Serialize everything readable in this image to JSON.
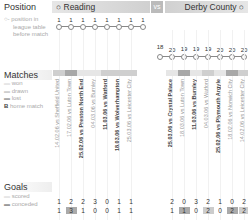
{
  "header": {
    "position_title": "Position",
    "home_team": "Reading",
    "vs": "vs",
    "away_team": "Derby County"
  },
  "legend": {
    "position": [
      "position in",
      "league table",
      "before match"
    ],
    "matches_title": "Matches",
    "matches": [
      "won",
      "drawn",
      "lost",
      "home match"
    ],
    "goals_title": "Goals",
    "goals": [
      "scored",
      "conceded"
    ]
  },
  "colors": {
    "won": "#e6e6e6",
    "drawn": "#cfcfcf",
    "lost": "#a8a8a8",
    "line": "#888888"
  },
  "chart_data": {
    "type": "table",
    "series": [
      {
        "name": "Reading",
        "positions": [
          1,
          1,
          1,
          1,
          1,
          1,
          1,
          1
        ],
        "matches": [
          {
            "label": "14.02.06 vs Sheffield United",
            "home": false,
            "result": "drawn",
            "scored": 1,
            "conceded": 1
          },
          {
            "label": "17.02.06 vs Luton Town",
            "home": false,
            "result": "lost",
            "scored": 2,
            "conceded": 3
          },
          {
            "label": "25.02.06 vs Preston North End",
            "home": true,
            "result": "won",
            "scored": 2,
            "conceded": 1
          },
          {
            "label": "04.03.06 vs Burnley",
            "home": false,
            "result": "won",
            "scored": 3,
            "conceded": 0
          },
          {
            "label": "11.03.06 vs Watford",
            "home": true,
            "result": "drawn",
            "scored": 0,
            "conceded": 0
          },
          {
            "label": "18.03.06 vs Wolverhampton",
            "home": true,
            "result": "drawn",
            "scored": 1,
            "conceded": 1
          },
          {
            "label": "25.03.06 vs Leicester City",
            "home": false,
            "result": "drawn",
            "scored": 1,
            "conceded": 1
          }
        ]
      },
      {
        "name": "Derby County",
        "positions": [
          18,
          20,
          19,
          19,
          19,
          20,
          20,
          20
        ],
        "matches": [
          {
            "label": "25.03.06 vs Crystal Palace",
            "home": true,
            "result": "won",
            "scored": 2,
            "conceded": 1
          },
          {
            "label": "18.03.06 vs Luton Town",
            "home": false,
            "result": "lost",
            "scored": 0,
            "conceded": 1
          },
          {
            "label": "11.03.06 vs Burnley",
            "home": true,
            "result": "won",
            "scored": 3,
            "conceded": 0
          },
          {
            "label": "04.03.06 vs Watford",
            "home": false,
            "result": "drawn",
            "scored": 2,
            "conceded": 2
          },
          {
            "label": "25.02.06 vs Plymouth Argyle",
            "home": true,
            "result": "won",
            "scored": 1,
            "conceded": 0
          },
          {
            "label": "18.02.06 vs Norwich City",
            "home": false,
            "result": "lost",
            "scored": 0,
            "conceded": 2
          },
          {
            "label": "14.02.06 vs Leicester City",
            "home": false,
            "result": "drawn",
            "scored": 2,
            "conceded": 2
          }
        ]
      }
    ]
  }
}
